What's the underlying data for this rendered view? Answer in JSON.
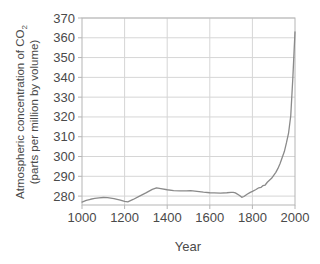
{
  "chart_data": {
    "type": "line",
    "title": "",
    "xlabel": "Year",
    "ylabel_line1": "Atmospheric concentration of CO",
    "ylabel_line1_sub": "2",
    "ylabel_line2": "(parts per million by volume)",
    "ylabel": "Atmospheric concentration of CO2 (parts per million by volume)",
    "xlim": [
      1000,
      2000
    ],
    "ylim": [
      275.5,
      370
    ],
    "xticks": [
      1000,
      1200,
      1400,
      1600,
      1800,
      2000
    ],
    "xtick_labels": [
      "1000",
      "1200",
      "1400",
      "1600",
      "1800",
      "2000"
    ],
    "yticks": [
      280,
      290,
      300,
      310,
      320,
      330,
      340,
      350,
      360,
      370
    ],
    "ytick_labels": [
      "280",
      "290",
      "300",
      "310",
      "320",
      "330",
      "340",
      "350",
      "360",
      "370"
    ],
    "grid": true,
    "legend": "none",
    "series": [
      {
        "name": "CO2 concentration",
        "color": "#8a8a8a",
        "x": [
          1000,
          1020,
          1040,
          1060,
          1080,
          1100,
          1120,
          1150,
          1180,
          1200,
          1215,
          1240,
          1270,
          1300,
          1330,
          1350,
          1370,
          1400,
          1430,
          1460,
          1490,
          1510,
          1540,
          1570,
          1600,
          1620,
          1650,
          1680,
          1700,
          1710,
          1720,
          1740,
          1750,
          1760,
          1775,
          1790,
          1800,
          1815,
          1830,
          1840,
          1850,
          1860,
          1870,
          1880,
          1890,
          1900,
          1910,
          1920,
          1930,
          1940,
          1950,
          1960,
          1970,
          1980,
          1990,
          2000
        ],
        "y": [
          277.0,
          277.8,
          278.4,
          278.8,
          279.1,
          279.3,
          279.2,
          278.7,
          278.0,
          277.3,
          277.1,
          278.3,
          280.0,
          281.6,
          283.4,
          284.2,
          283.8,
          283.2,
          282.8,
          282.6,
          282.6,
          282.8,
          282.4,
          282.0,
          281.7,
          281.6,
          281.5,
          281.7,
          281.9,
          281.9,
          281.6,
          280.3,
          279.4,
          279.8,
          280.9,
          281.9,
          282.4,
          283.2,
          284.2,
          284.4,
          285.3,
          285.6,
          287.0,
          288.0,
          289.0,
          290.5,
          292.0,
          294.0,
          296.5,
          299.5,
          302.5,
          307.0,
          312.0,
          320.5,
          340.0,
          363.0
        ]
      }
    ]
  },
  "axis": {
    "xlabel": "Year",
    "ylabel_part1": "Atmospheric concentration of CO",
    "ylabel_sub": "2",
    "ylabel_part2": "(parts per million by volume)"
  },
  "colors": {
    "line": "#8a8a8a",
    "grid": "#d6d6d6",
    "frame": "#b5b5b5",
    "text": "#4a4a4a",
    "background": "#ffffff"
  }
}
